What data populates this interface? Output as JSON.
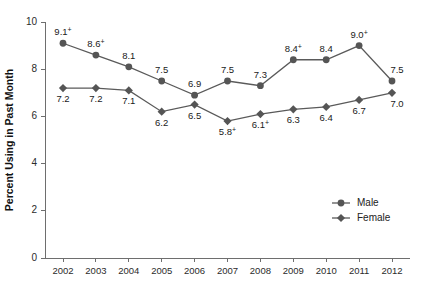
{
  "chart_data": {
    "type": "line",
    "title": "",
    "xlabel": "",
    "ylabel": "Percent Using in Past Month",
    "categories": [
      "2002",
      "2003",
      "2004",
      "2005",
      "2006",
      "2007",
      "2008",
      "2009",
      "2010",
      "2011",
      "2012"
    ],
    "ylim": [
      0,
      10
    ],
    "yticks": [
      0,
      2,
      4,
      6,
      8,
      10
    ],
    "ytick_labels": [
      "0",
      "2",
      "4",
      "6",
      "8",
      "10"
    ],
    "grid": false,
    "legend_position": "bottom-right",
    "series": [
      {
        "name": "Male",
        "marker": "circle",
        "values": [
          9.1,
          8.6,
          8.1,
          7.5,
          6.9,
          7.5,
          7.3,
          8.4,
          8.4,
          9.0,
          7.5
        ],
        "labels": [
          "9.1",
          "8.6",
          "8.1",
          "7.5",
          "6.9",
          "7.5",
          "7.3",
          "8.4",
          "8.4",
          "9.0",
          "7.5"
        ],
        "significance": [
          "+",
          "+",
          "",
          "",
          "",
          "",
          "",
          "+",
          "",
          "+",
          ""
        ]
      },
      {
        "name": "Female",
        "marker": "diamond",
        "values": [
          7.2,
          7.2,
          7.1,
          6.2,
          6.5,
          5.8,
          6.1,
          6.3,
          6.4,
          6.7,
          7.0
        ],
        "labels": [
          "7.2",
          "7.2",
          "7.1",
          "6.2",
          "6.5",
          "5.8",
          "6.1",
          "6.3",
          "6.4",
          "6.7",
          "7.0"
        ],
        "significance": [
          "",
          "",
          "",
          "",
          "",
          "+",
          "+",
          "",
          "",
          "",
          ""
        ]
      }
    ]
  },
  "axis": {
    "y_title": "Percent Using in Past Month"
  },
  "legend": {
    "items": [
      {
        "label": "Male",
        "marker": "circle"
      },
      {
        "label": "Female",
        "marker": "diamond"
      }
    ]
  },
  "colors": {
    "marker": "#555555",
    "line": "#5a5a5a",
    "axis": "#6e6e6e",
    "text": "#1a1a1a",
    "background": "#ffffff"
  }
}
